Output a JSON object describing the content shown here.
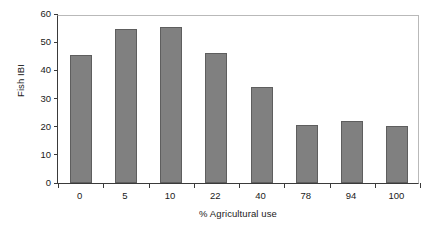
{
  "chart_data": {
    "type": "bar",
    "title": "",
    "subtitle": "",
    "xlabel": "% Agricultural use",
    "ylabel": "Fish IBI",
    "categories": [
      "0",
      "5",
      "10",
      "22",
      "40",
      "78",
      "94",
      "100"
    ],
    "values": [
      45.3,
      54.6,
      55.5,
      46.3,
      34.2,
      20.6,
      21.9,
      20.2
    ],
    "ylim": [
      0,
      60
    ],
    "yticks": [
      "0",
      "10",
      "20",
      "30",
      "40",
      "50",
      "60"
    ],
    "ytick_values": [
      0,
      10,
      20,
      30,
      40,
      50,
      60
    ],
    "grid": false,
    "legend": null,
    "bar_color": "#808080",
    "bar_edge_color": "#5e5e5e",
    "axis_color": "#3a3a3a",
    "frame_color": "#b9b9b9",
    "background": "#ffffff",
    "annotations": []
  }
}
